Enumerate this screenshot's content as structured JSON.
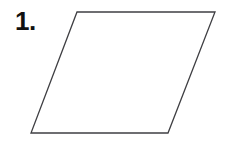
{
  "figure": {
    "label": "1.",
    "shape_name": "parallelogram",
    "background_color": "#ffffff",
    "stroke_color": "#3f3f43",
    "fill_color": "#ffffff",
    "stroke_width": 1.3,
    "vertices": [
      {
        "name": "top-left",
        "x": 77,
        "y": 12
      },
      {
        "name": "top-right",
        "x": 215,
        "y": 12
      },
      {
        "name": "bottom-right",
        "x": 168,
        "y": 133
      },
      {
        "name": "bottom-left",
        "x": 31,
        "y": 133
      }
    ],
    "points_attr": "77,12 215,12 168,133 31,133",
    "label_color": "#111111"
  }
}
